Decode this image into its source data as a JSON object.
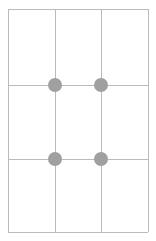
{
  "canvas": {
    "width": 156,
    "height": 241,
    "background_color": "#ffffff"
  },
  "grid": {
    "name": "three-by-three-grid",
    "columns": 3,
    "rows": 3,
    "line_color": "#bbbbbb",
    "line_width": 1,
    "bounds": {
      "left": 8,
      "top": 9,
      "right": 148,
      "bottom": 232
    },
    "vertical_lines": [
      {
        "name": "grid-line-v-0",
        "x": 8,
        "y": 9,
        "length": 223
      },
      {
        "name": "grid-line-v-1",
        "x": 55,
        "y": 9,
        "length": 223
      },
      {
        "name": "grid-line-v-2",
        "x": 101,
        "y": 9,
        "length": 223
      },
      {
        "name": "grid-line-v-3",
        "x": 148,
        "y": 9,
        "length": 223
      }
    ],
    "horizontal_lines": [
      {
        "name": "grid-line-h-0",
        "y": 9,
        "x": 8,
        "length": 140
      },
      {
        "name": "grid-line-h-1",
        "y": 85,
        "x": 8,
        "length": 140
      },
      {
        "name": "grid-line-h-2",
        "y": 159,
        "x": 8,
        "length": 140
      },
      {
        "name": "grid-line-h-3",
        "y": 232,
        "x": 8,
        "length": 140
      }
    ],
    "column_x_positions": [
      8,
      55,
      101,
      148
    ],
    "row_y_positions": [
      9,
      85,
      159,
      232
    ]
  },
  "markers": {
    "color": "#a0a0a0",
    "diameter": 14,
    "count": 4,
    "points": [
      {
        "name": "intersection-dot-r1-c1",
        "cx": 55,
        "cy": 85,
        "row": 1,
        "column": 1
      },
      {
        "name": "intersection-dot-r1-c2",
        "cx": 101,
        "cy": 85,
        "row": 1,
        "column": 2
      },
      {
        "name": "intersection-dot-r2-c1",
        "cx": 55,
        "cy": 159,
        "row": 2,
        "column": 1
      },
      {
        "name": "intersection-dot-r2-c2",
        "cx": 101,
        "cy": 159,
        "row": 2,
        "column": 2
      }
    ]
  }
}
